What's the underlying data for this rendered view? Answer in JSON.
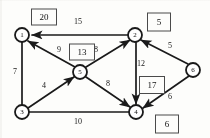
{
  "diagram": {
    "stroke_color": "#1a1a1a",
    "node_fill": "#ffffff",
    "box_border": "#4a4a4a",
    "nodes": [
      {
        "id": "n1",
        "label": "1",
        "x": 22,
        "y": 35
      },
      {
        "id": "n2",
        "label": "2",
        "x": 135,
        "y": 35
      },
      {
        "id": "n3",
        "label": "3",
        "x": 22,
        "y": 112
      },
      {
        "id": "n4",
        "label": "4",
        "x": 136,
        "y": 112
      },
      {
        "id": "n5",
        "label": "5",
        "x": 80,
        "y": 72
      },
      {
        "id": "n6",
        "label": "6",
        "x": 193,
        "y": 70
      }
    ],
    "edges": [
      {
        "id": "e-2-1",
        "from": "n2",
        "to": "n1",
        "weight": "15",
        "label_x": 78,
        "label_y": 22,
        "arrow": true
      },
      {
        "id": "e-1-3",
        "from": "n1",
        "to": "n3",
        "weight": "7",
        "label_x": 15,
        "label_y": 72,
        "arrow": false
      },
      {
        "id": "e-5-1",
        "from": "n5",
        "to": "n1",
        "weight": "9",
        "label_x": 59,
        "label_y": 50,
        "arrow": true
      },
      {
        "id": "e-5-2",
        "from": "n5",
        "to": "n2",
        "weight": "8",
        "label_x": 96,
        "label_y": 50,
        "arrow": true
      },
      {
        "id": "e-3-5",
        "from": "n3",
        "to": "n5",
        "weight": "4",
        "label_x": 44,
        "label_y": 86,
        "arrow": true
      },
      {
        "id": "e-5-4",
        "from": "n5",
        "to": "n4",
        "weight": "8",
        "label_x": 108,
        "label_y": 84,
        "arrow": true
      },
      {
        "id": "e-3-4",
        "from": "n3",
        "to": "n4",
        "weight": "10",
        "label_x": 78,
        "label_y": 122,
        "arrow": false
      },
      {
        "id": "e-2-4",
        "from": "n2",
        "to": "n4",
        "weight": "12",
        "label_x": 141,
        "label_y": 64,
        "arrow": true
      },
      {
        "id": "e-6-2",
        "from": "n6",
        "to": "n2",
        "weight": "5",
        "label_x": 170,
        "label_y": 46,
        "arrow": true
      },
      {
        "id": "e-6-4",
        "from": "n6",
        "to": "n4",
        "weight": "6",
        "label_x": 170,
        "label_y": 97,
        "arrow": true
      }
    ],
    "potential_boxes": [
      {
        "id": "box-n1",
        "value": "20",
        "x": 44,
        "y": 17,
        "w": 24,
        "h": 15
      },
      {
        "id": "box-n2",
        "value": "5",
        "x": 159,
        "y": 22,
        "w": 22,
        "h": 17
      },
      {
        "id": "box-n5",
        "value": "13",
        "x": 82,
        "y": 52,
        "w": 24,
        "h": 15
      },
      {
        "id": "box-n4",
        "value": "17",
        "x": 152,
        "y": 85,
        "w": 24,
        "h": 16
      },
      {
        "id": "box-n6",
        "value": "6",
        "x": 167,
        "y": 124,
        "w": 22,
        "h": 17
      }
    ]
  }
}
